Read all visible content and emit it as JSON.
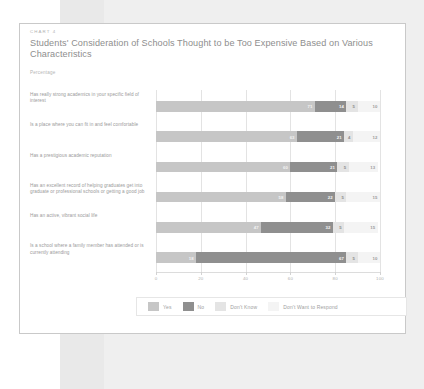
{
  "card": {
    "kicker": "CHART 4",
    "title": "Students' Consideration of Schools Thought to be Too Expensive Based on Various Characteristics",
    "subtitle": "Percentage"
  },
  "colors": {
    "yes": "#c6c6c6",
    "no": "#8f8f8f",
    "dont_know": "#e4e4e4",
    "dont_want_to_respond": "#f4f4f4",
    "gridline": "#e3e3e3",
    "card_border": "#c9c9c9",
    "title_text": "#8e8e8e",
    "label_text": "#9a9a9a"
  },
  "legend": {
    "items": [
      {
        "label": "Yes",
        "color_key": "yes"
      },
      {
        "label": "No",
        "color_key": "no"
      },
      {
        "label": "Don't Know",
        "color_key": "dont_know"
      },
      {
        "label": "Don't Want to Respond",
        "color_key": "dont_want_to_respond"
      }
    ]
  },
  "chart_data": {
    "type": "bar",
    "orientation": "horizontal",
    "stacked": true,
    "stacked_mode": "percent",
    "title": "Students' Consideration of Schools Thought to be Too Expensive Based on Various Characteristics",
    "subtitle": "Percentage",
    "kicker": "CHART 4",
    "xlabel": "",
    "ylabel": "",
    "xlim": [
      0,
      100
    ],
    "xticks": [
      0,
      20,
      40,
      60,
      80,
      100
    ],
    "xtick_labels": [
      "0",
      "20",
      "40",
      "60",
      "80",
      "100"
    ],
    "grid": true,
    "grid_axis": "x",
    "legend_position": "bottom",
    "categories": [
      "Has really strong academics in your specific field of interest",
      "Is a place where you can fit in and feel comfortable",
      "Has a prestigious academic reputation",
      "Has an excellent record of helping graduates get into graduate or professional schools or getting a good job",
      "Has an active, vibrant social life",
      "Is a school where a family member has attended or is currently attending"
    ],
    "series": [
      {
        "name": "Yes",
        "values": [
          71,
          63,
          60,
          58,
          47,
          18
        ]
      },
      {
        "name": "No",
        "values": [
          14,
          21,
          21,
          22,
          32,
          67
        ]
      },
      {
        "name": "Don't Know",
        "values": [
          5,
          4,
          5,
          5,
          5,
          5
        ]
      },
      {
        "name": "Don't Want to Respond",
        "values": [
          10,
          12,
          13,
          15,
          15,
          10
        ]
      }
    ]
  }
}
